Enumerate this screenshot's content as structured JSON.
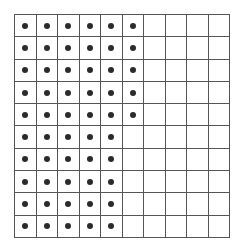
{
  "grid": {
    "rows": 10,
    "columns": 10,
    "dots_per_row": [
      6,
      6,
      6,
      6,
      6,
      5,
      5,
      5,
      5,
      5
    ],
    "total_dots": 55,
    "line_color": "#555555",
    "dot_color": "#2b2b2b"
  }
}
